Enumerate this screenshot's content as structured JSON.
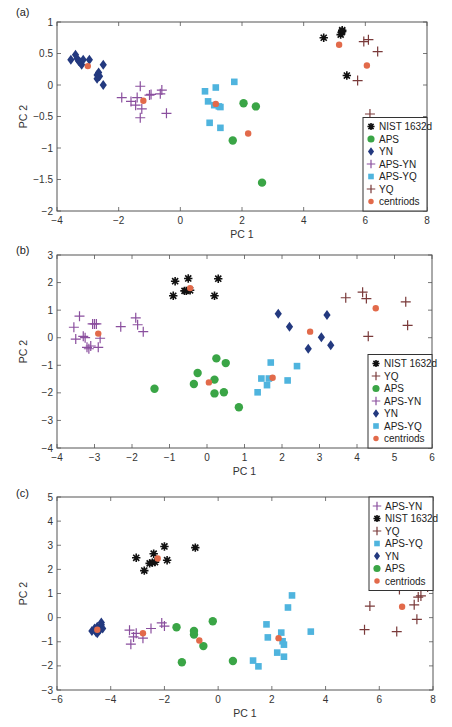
{
  "colors": {
    "NIST 1632d": "#111111",
    "APS": "#3aa546",
    "YN": "#23397f",
    "APS-YN": "#8a4f9e",
    "APS-YQ": "#4fb4de",
    "YQ": "#7a3a3a",
    "centriods": "#e26a4a"
  },
  "markers": {
    "NIST 1632d": "asterisk",
    "APS": "circle",
    "YN": "diamond",
    "APS-YN": "plus",
    "APS-YQ": "square",
    "YQ": "plus",
    "centriods": "dot"
  },
  "chart_data": [
    {
      "panel_label": "(a)",
      "type": "scatter",
      "title": "",
      "xlabel": "PC 1",
      "ylabel": "PC 2",
      "xlim": [
        -4,
        8
      ],
      "ylim": [
        -2,
        1
      ],
      "xticks": [
        -4,
        -2,
        0,
        2,
        4,
        6,
        8
      ],
      "yticks": [
        -2,
        -1.5,
        -1,
        -0.5,
        0,
        0.5,
        1
      ],
      "grid": false,
      "legend_position": "lower right",
      "legend": [
        "NIST 1632d",
        "APS",
        "YN",
        "APS-YN",
        "APS-YQ",
        "YQ",
        "centriods"
      ],
      "series": [
        {
          "name": "NIST 1632d",
          "points": [
            [
              4.65,
              0.75
            ],
            [
              5.2,
              0.8
            ],
            [
              5.25,
              0.85
            ],
            [
              5.25,
              0.87
            ],
            [
              5.4,
              0.15
            ]
          ]
        },
        {
          "name": "APS",
          "points": [
            [
              2.05,
              -0.29
            ],
            [
              2.45,
              -0.34
            ],
            [
              1.7,
              -0.88
            ],
            [
              2.65,
              -1.55
            ]
          ]
        },
        {
          "name": "YN",
          "points": [
            [
              -3.55,
              0.4
            ],
            [
              -3.4,
              0.48
            ],
            [
              -3.35,
              0.42
            ],
            [
              -3.3,
              0.38
            ],
            [
              -3.25,
              0.36
            ],
            [
              -3.2,
              0.32
            ],
            [
              -3.15,
              0.4
            ],
            [
              -2.95,
              0.4
            ],
            [
              -2.7,
              0.16
            ],
            [
              -2.65,
              0.2
            ],
            [
              -2.62,
              0.14
            ],
            [
              -2.7,
              0.1
            ],
            [
              -2.5,
              0.32
            ],
            [
              -2.5,
              0.0
            ]
          ]
        },
        {
          "name": "APS-YN",
          "points": [
            [
              -1.9,
              -0.2
            ],
            [
              -1.6,
              -0.26
            ],
            [
              -1.45,
              -0.32
            ],
            [
              -1.4,
              -0.2
            ],
            [
              -1.3,
              -0.02
            ],
            [
              -1.25,
              -0.38
            ],
            [
              -1.3,
              -0.52
            ],
            [
              -1.0,
              -0.16
            ],
            [
              -0.95,
              -0.15
            ],
            [
              -0.65,
              -0.14
            ],
            [
              -0.6,
              -0.08
            ],
            [
              -0.45,
              -0.45
            ]
          ]
        },
        {
          "name": "APS-YQ",
          "points": [
            [
              0.8,
              -0.1
            ],
            [
              0.9,
              -0.26
            ],
            [
              1.15,
              -0.04
            ],
            [
              1.1,
              -0.32
            ],
            [
              1.25,
              -0.34
            ],
            [
              1.3,
              -0.35
            ],
            [
              1.75,
              0.05
            ],
            [
              0.95,
              -0.6
            ],
            [
              1.3,
              -0.68
            ]
          ]
        },
        {
          "name": "YQ",
          "points": [
            [
              5.95,
              0.69
            ],
            [
              6.1,
              0.72
            ],
            [
              6.4,
              0.53
            ],
            [
              5.75,
              0.07
            ],
            [
              6.15,
              -0.46
            ]
          ]
        },
        {
          "name": "centriods",
          "points": [
            [
              -3.0,
              0.3
            ],
            [
              -1.2,
              -0.25
            ],
            [
              1.15,
              -0.3
            ],
            [
              2.2,
              -0.77
            ],
            [
              5.15,
              0.64
            ],
            [
              6.05,
              0.31
            ]
          ]
        }
      ]
    },
    {
      "panel_label": "(b)",
      "type": "scatter",
      "title": "",
      "xlabel": "PC 1",
      "ylabel": "PC 2",
      "xlim": [
        -4,
        6
      ],
      "ylim": [
        -4,
        3
      ],
      "xticks": [
        -4,
        -3,
        -2,
        -1,
        0,
        1,
        2,
        3,
        4,
        5,
        6
      ],
      "yticks": [
        -4,
        -3,
        -2,
        -1,
        0,
        1,
        2,
        3
      ],
      "grid": false,
      "legend_position": "lower right",
      "legend": [
        "NIST 1632d",
        "YQ",
        "APS",
        "APS-YN",
        "YN",
        "APS-YQ",
        "centriods"
      ],
      "series": [
        {
          "name": "NIST 1632d",
          "points": [
            [
              -0.9,
              1.52
            ],
            [
              -0.85,
              2.05
            ],
            [
              -0.6,
              1.7
            ],
            [
              -0.55,
              1.7
            ],
            [
              -0.5,
              2.15
            ],
            [
              -0.45,
              1.72
            ],
            [
              0.2,
              1.52
            ],
            [
              0.3,
              2.14
            ]
          ]
        },
        {
          "name": "YQ",
          "points": [
            [
              3.7,
              1.45
            ],
            [
              4.15,
              1.65
            ],
            [
              4.25,
              1.42
            ],
            [
              5.3,
              1.3
            ],
            [
              5.35,
              0.45
            ],
            [
              4.3,
              0.05
            ]
          ]
        },
        {
          "name": "APS",
          "points": [
            [
              -1.4,
              -1.85
            ],
            [
              -0.35,
              -1.68
            ],
            [
              -0.25,
              -1.28
            ],
            [
              0.2,
              -2.02
            ],
            [
              0.2,
              -1.52
            ],
            [
              0.25,
              -0.75
            ],
            [
              0.45,
              -1.98
            ],
            [
              0.5,
              -0.92
            ],
            [
              0.85,
              -2.52
            ]
          ]
        },
        {
          "name": "APS-YN",
          "points": [
            [
              -3.55,
              0.38
            ],
            [
              -3.5,
              -0.05
            ],
            [
              -3.4,
              0.78
            ],
            [
              -3.3,
              0.05
            ],
            [
              -3.25,
              0.0
            ],
            [
              -3.2,
              -0.35
            ],
            [
              -3.15,
              -0.4
            ],
            [
              -3.1,
              -0.3
            ],
            [
              -3.05,
              0.5
            ],
            [
              -3.0,
              0.5
            ],
            [
              -2.95,
              0.5
            ],
            [
              -2.9,
              -0.35
            ],
            [
              -2.85,
              -0.02
            ],
            [
              -2.3,
              0.4
            ],
            [
              -1.9,
              0.72
            ],
            [
              -1.85,
              0.47
            ],
            [
              -1.7,
              0.22
            ]
          ]
        },
        {
          "name": "YN",
          "points": [
            [
              1.9,
              0.87
            ],
            [
              2.2,
              0.4
            ],
            [
              2.7,
              -0.4
            ],
            [
              3.05,
              0.02
            ],
            [
              3.2,
              0.82
            ],
            [
              3.3,
              -0.27
            ]
          ]
        },
        {
          "name": "APS-YQ",
          "points": [
            [
              1.35,
              -1.98
            ],
            [
              1.45,
              -1.48
            ],
            [
              1.6,
              -1.72
            ],
            [
              1.65,
              -1.48
            ],
            [
              1.7,
              -0.9
            ],
            [
              2.15,
              -1.55
            ],
            [
              2.4,
              -1.03
            ]
          ]
        },
        {
          "name": "centriods",
          "points": [
            [
              -2.9,
              0.15
            ],
            [
              -0.45,
              1.8
            ],
            [
              0.05,
              -1.62
            ],
            [
              1.75,
              -1.45
            ],
            [
              2.75,
              0.22
            ],
            [
              4.5,
              1.07
            ]
          ]
        }
      ]
    },
    {
      "panel_label": "(c)",
      "type": "scatter",
      "title": "",
      "xlabel": "PC 1",
      "ylabel": "PC 2",
      "xlim": [
        -6,
        8
      ],
      "ylim": [
        -3,
        5
      ],
      "xticks": [
        -6,
        -4,
        -2,
        0,
        2,
        4,
        6,
        8
      ],
      "yticks": [
        -3,
        -2,
        -1,
        0,
        1,
        2,
        3,
        4,
        5
      ],
      "grid": false,
      "legend_position": "upper right",
      "legend": [
        "APS-YN",
        "NIST 1632d",
        "YQ",
        "APS-YQ",
        "YN",
        "APS",
        "centriods"
      ],
      "series": [
        {
          "name": "APS-YN",
          "points": [
            [
              -3.3,
              -0.52
            ],
            [
              -3.25,
              -1.1
            ],
            [
              -3.15,
              -0.8
            ],
            [
              -3.05,
              -0.65
            ],
            [
              -2.8,
              -0.85
            ],
            [
              -2.5,
              -0.45
            ],
            [
              -2.1,
              -0.22
            ],
            [
              -2.0,
              -0.35
            ]
          ]
        },
        {
          "name": "NIST 1632d",
          "points": [
            [
              -3.05,
              2.48
            ],
            [
              -2.75,
              1.95
            ],
            [
              -2.55,
              2.25
            ],
            [
              -2.45,
              2.28
            ],
            [
              -2.4,
              2.65
            ],
            [
              -2.35,
              2.3
            ],
            [
              -2.0,
              2.95
            ],
            [
              -1.9,
              2.38
            ],
            [
              -0.85,
              2.9
            ]
          ]
        },
        {
          "name": "YQ",
          "points": [
            [
              5.45,
              -0.5
            ],
            [
              5.65,
              0.48
            ],
            [
              6.65,
              -0.58
            ],
            [
              6.75,
              1.17
            ],
            [
              7.3,
              0.53
            ],
            [
              7.4,
              -0.07
            ],
            [
              7.45,
              0.85
            ],
            [
              7.55,
              0.9
            ],
            [
              7.8,
              1.27
            ]
          ]
        },
        {
          "name": "APS-YQ",
          "points": [
            [
              1.3,
              -1.78
            ],
            [
              1.5,
              -2.02
            ],
            [
              1.8,
              -0.28
            ],
            [
              1.85,
              -0.82
            ],
            [
              2.2,
              -1.45
            ],
            [
              2.35,
              -0.62
            ],
            [
              2.4,
              -0.98
            ],
            [
              2.45,
              -1.12
            ],
            [
              2.45,
              -1.62
            ],
            [
              2.6,
              0.42
            ],
            [
              2.75,
              0.92
            ],
            [
              3.45,
              -0.58
            ]
          ]
        },
        {
          "name": "YN",
          "points": [
            [
              -4.7,
              -0.55
            ],
            [
              -4.6,
              -0.45
            ],
            [
              -4.55,
              -0.6
            ],
            [
              -4.5,
              -0.38
            ],
            [
              -4.45,
              -0.55
            ],
            [
              -4.4,
              -0.5
            ],
            [
              -4.35,
              -0.3
            ],
            [
              -4.3,
              -0.45
            ],
            [
              -4.35,
              -0.2
            ],
            [
              -4.5,
              -0.65
            ]
          ]
        },
        {
          "name": "APS",
          "points": [
            [
              -1.55,
              -0.4
            ],
            [
              -1.35,
              -1.85
            ],
            [
              -0.9,
              -0.55
            ],
            [
              -0.9,
              -0.7
            ],
            [
              -0.55,
              -1.18
            ],
            [
              -0.2,
              -0.15
            ],
            [
              0.55,
              -1.8
            ]
          ]
        },
        {
          "name": "centriods",
          "points": [
            [
              -4.5,
              -0.5
            ],
            [
              -2.8,
              -0.65
            ],
            [
              -2.25,
              2.45
            ],
            [
              -0.7,
              -0.95
            ],
            [
              2.25,
              -0.85
            ],
            [
              6.85,
              0.45
            ]
          ]
        }
      ]
    }
  ]
}
